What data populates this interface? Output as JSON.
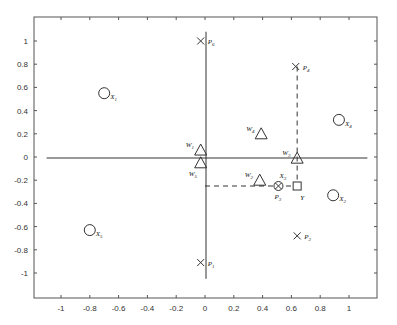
{
  "chart_data": {
    "type": "scatter",
    "title": "",
    "xlabel": "",
    "ylabel": "",
    "xlim": [
      -1.2,
      1.2
    ],
    "ylim": [
      -1.2,
      1.2
    ],
    "grid": false,
    "legend": null,
    "x_ticks": [
      -1,
      -0.8,
      -0.6,
      -0.4,
      -0.2,
      0,
      0.2,
      0.4,
      0.6,
      0.8,
      1
    ],
    "x_tick_labels": [
      "-1",
      "-0.8",
      "-0.6",
      "-0.4",
      "-0.2",
      "0",
      "0.2",
      "0.4",
      "0.6",
      "0.8",
      "1"
    ],
    "y_ticks": [
      1,
      0.8,
      0.6,
      0.4,
      0.2,
      0,
      -0.2,
      -0.4,
      -0.6,
      -0.8,
      -1
    ],
    "y_tick_labels": [
      "1",
      "0.8",
      "0.6",
      "0.4",
      "0.2",
      "0",
      "-0.2",
      "-0.4",
      "-0.6",
      "-0.8",
      "-1"
    ],
    "series": [
      {
        "name": "X (circles)",
        "marker": "circle",
        "points": [
          {
            "label": "X",
            "sub": "1",
            "x": -0.7,
            "y": 0.55
          },
          {
            "label": "X",
            "sub": "2",
            "x": 0.89,
            "y": -0.33
          },
          {
            "label": "X",
            "sub": "4",
            "x": 0.93,
            "y": 0.32
          },
          {
            "label": "X",
            "sub": "5",
            "x": -0.8,
            "y": -0.63
          }
        ]
      },
      {
        "name": "X3 / P3 (circle with cross)",
        "marker": "otimes",
        "points": [
          {
            "label": "X",
            "sub": "3",
            "label2": "P",
            "sub2": "3",
            "x": 0.51,
            "y": -0.25
          }
        ]
      },
      {
        "name": "P (crosses)",
        "marker": "x",
        "points": [
          {
            "label": "P",
            "sub": "6",
            "x": -0.03,
            "y": 1.0
          },
          {
            "label": "P",
            "sub": "4",
            "x": 0.63,
            "y": 0.78
          },
          {
            "label": "P",
            "sub": "2",
            "x": 0.64,
            "y": -0.68
          },
          {
            "label": "P",
            "sub": "1",
            "x": -0.03,
            "y": -0.91
          }
        ]
      },
      {
        "name": "W (triangles)",
        "marker": "triangle",
        "points": [
          {
            "label": "W",
            "sub": "1",
            "x": -0.03,
            "y": 0.06
          },
          {
            "label": "W",
            "sub": "5",
            "x": -0.03,
            "y": -0.05
          },
          {
            "label": "W",
            "sub": "4",
            "x": 0.39,
            "y": 0.2
          },
          {
            "label": "W",
            "sub": "3",
            "x": 0.64,
            "y": -0.01
          },
          {
            "label": "W",
            "sub": "2",
            "x": 0.38,
            "y": -0.2
          }
        ]
      },
      {
        "name": "Y (square)",
        "marker": "square",
        "points": [
          {
            "label": "Y",
            "sub": "",
            "x": 0.64,
            "y": -0.25
          }
        ]
      }
    ],
    "reference_lines": {
      "horizontal_axis": {
        "y": 0,
        "x_from": -1.1,
        "x_to": 1.1
      },
      "vertical_axis": {
        "x": 0,
        "y_from": -1.05,
        "y_to": 1.08
      },
      "dashed": [
        {
          "from": [
            0.64,
            0.78
          ],
          "to": [
            0.64,
            -0.25
          ]
        },
        {
          "from": [
            0,
            -0.25
          ],
          "to": [
            0.64,
            -0.25
          ]
        }
      ]
    }
  }
}
